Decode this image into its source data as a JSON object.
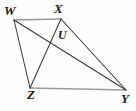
{
  "figure": {
    "type": "geometry-diagram",
    "background_color": "#fefefe",
    "stroke_color_dark": "#3a3a3a",
    "stroke_color_light": "#9a9a9a",
    "labels": {
      "w": "W",
      "x": "X",
      "u": "U",
      "z": "Z",
      "y": "Y"
    },
    "vertices": [
      {
        "name": "W",
        "x": 14,
        "y": 20
      },
      {
        "name": "X",
        "x": 61,
        "y": 19
      },
      {
        "name": "U",
        "x": 56,
        "y": 37
      },
      {
        "name": "Z",
        "x": 30,
        "y": 88
      },
      {
        "name": "Y",
        "x": 126,
        "y": 90
      }
    ],
    "segments": [
      {
        "name": "WX",
        "from": "W",
        "to": "X",
        "shade": "light"
      },
      {
        "name": "ZY",
        "from": "Z",
        "to": "Y",
        "shade": "light"
      },
      {
        "name": "WZ",
        "from": "W",
        "to": "Z",
        "shade": "dark"
      },
      {
        "name": "XY",
        "from": "X",
        "to": "Y",
        "shade": "dark"
      },
      {
        "name": "WY",
        "from": "W",
        "to": "Y",
        "shade": "dark"
      },
      {
        "name": "XZ",
        "from": "X",
        "to": "Z",
        "shade": "dark"
      }
    ]
  }
}
